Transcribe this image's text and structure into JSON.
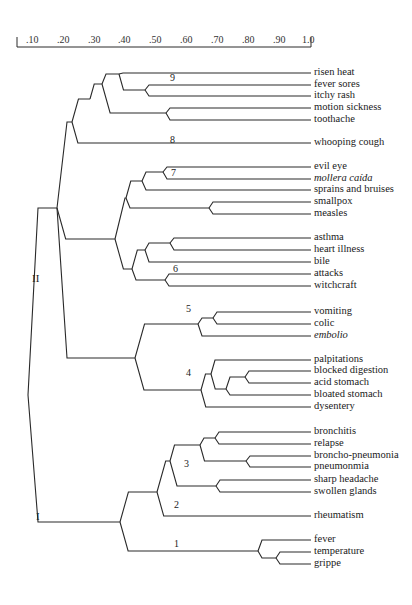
{
  "chart_data": {
    "type": "dendrogram",
    "title": "",
    "axis": {
      "ticks": [
        ".10",
        ".20",
        ".30",
        ".40",
        ".50",
        ".60",
        ".70",
        ".80",
        ".90",
        "1.0"
      ],
      "tick_x": [
        26,
        57,
        88,
        118,
        149,
        180,
        211,
        242,
        273,
        302
      ],
      "x_start": 17,
      "x_end": 311,
      "y": 47,
      "range": [
        0.05,
        1.0
      ]
    },
    "groups": [
      {
        "label": "II",
        "x": 32,
        "y": 278
      },
      {
        "label": "I",
        "x": 36,
        "y": 516
      }
    ],
    "clusters": [
      {
        "label": "9",
        "x": 60,
        "y": 100,
        "px": 57,
        "py": 98
      },
      {
        "label": "8",
        "x": 56,
        "y": 141,
        "px": 53,
        "py": 139
      },
      {
        "label": "7",
        "x": 80,
        "y": 181,
        "px": 60,
        "py": 180
      },
      {
        "label": "6",
        "x": 85,
        "y": 262,
        "px": 77,
        "py": 261
      },
      {
        "label": "5",
        "x": 185,
        "y": 321,
        "px": 185,
        "py": 320
      },
      {
        "label": "4",
        "x": 185,
        "y": 381,
        "px": 185,
        "py": 380
      },
      {
        "label": "3",
        "x": 185,
        "y": 467,
        "px": 186,
        "py": 466
      },
      {
        "label": "2",
        "x": 177,
        "y": 509,
        "px": 176,
        "py": 508
      },
      {
        "label": "1",
        "x": 177,
        "y": 547,
        "px": 177,
        "py": 546
      }
    ],
    "leaves": [
      {
        "label": "risen heat",
        "y": 73,
        "italic": false
      },
      {
        "label": "fever sores",
        "y": 85,
        "italic": false
      },
      {
        "label": "itchy rash",
        "y": 96,
        "italic": false
      },
      {
        "label": "motion sickness",
        "y": 108,
        "italic": false
      },
      {
        "label": "toothache",
        "y": 120,
        "italic": false
      },
      {
        "label": "whooping cough",
        "y": 143,
        "italic": false
      },
      {
        "label": "evil eye",
        "y": 167,
        "italic": false
      },
      {
        "label": "mollera caída",
        "y": 179,
        "italic": true
      },
      {
        "label": "sprains and bruises",
        "y": 190,
        "italic": false
      },
      {
        "label": "smallpox",
        "y": 202,
        "italic": false
      },
      {
        "label": "measles",
        "y": 214,
        "italic": false
      },
      {
        "label": "asthma",
        "y": 238,
        "italic": false
      },
      {
        "label": "heart illness",
        "y": 250,
        "italic": false
      },
      {
        "label": "bile",
        "y": 262,
        "italic": false
      },
      {
        "label": "attacks",
        "y": 274,
        "italic": false
      },
      {
        "label": "witchcraft",
        "y": 286,
        "italic": false
      },
      {
        "label": "vomiting",
        "y": 312,
        "italic": false
      },
      {
        "label": "colic",
        "y": 324,
        "italic": false
      },
      {
        "label": "embolio",
        "y": 336,
        "italic": true
      },
      {
        "label": "palpitations",
        "y": 360,
        "italic": false
      },
      {
        "label": "blocked digestion",
        "y": 371,
        "italic": false
      },
      {
        "label": "acid stomach",
        "y": 383,
        "italic": false
      },
      {
        "label": "bloated stomach",
        "y": 395,
        "italic": false
      },
      {
        "label": "dysentery",
        "y": 407,
        "italic": false
      },
      {
        "label": "bronchitis",
        "y": 432,
        "italic": false
      },
      {
        "label": "relapse",
        "y": 444,
        "italic": false
      },
      {
        "label": "broncho-pneumonia",
        "y": 456,
        "italic": false
      },
      {
        "label": "pneumonmia",
        "y": 467,
        "italic": false
      },
      {
        "label": "sharp headache",
        "y": 480,
        "italic": false
      },
      {
        "label": "swollen glands",
        "y": 492,
        "italic": false
      },
      {
        "label": "rheumatism",
        "y": 516,
        "italic": false
      },
      {
        "label": "fever",
        "y": 540,
        "italic": false
      },
      {
        "label": "temperature",
        "y": 552,
        "italic": false
      },
      {
        "label": "grippe",
        "y": 564,
        "italic": false
      }
    ],
    "leaf_x_end": 311,
    "tree": {
      "id": "root",
      "x": 28,
      "y": 395,
      "children": [
        {
          "id": "II",
          "x": 57,
          "y": 208,
          "children": [
            {
              "id": "II-a",
              "x": 72,
              "y": 122,
              "children": [
                {
                  "id": "c9",
                  "x": 90,
                  "y": 99,
                  "children": [
                    {
                      "x": 102,
                      "y": 84,
                      "children": [
                        {
                          "x": 119,
                          "y": 74,
                          "children": [
                            {
                              "leaf": 0
                            },
                            {
                              "x": 145,
                              "y": 90,
                              "children": [
                                {
                                  "leaf": 1
                                },
                                {
                                  "leaf": 2
                                }
                              ]
                            }
                          ]
                        },
                        {
                          "x": 166,
                          "y": 113,
                          "children": [
                            {
                              "leaf": 3
                            },
                            {
                              "leaf": 4
                            }
                          ]
                        }
                      ]
                    }
                  ]
                },
                {
                  "id": "c8",
                  "leaf": 5
                }
              ]
            },
            {
              "id": "II-b",
              "x": 115,
              "y": 239,
              "children": [
                {
                  "id": "c7",
                  "x": 126,
                  "y": 198,
                  "children": [
                    {
                      "x": 142,
                      "y": 181,
                      "children": [
                        {
                          "x": 163,
                          "y": 172,
                          "children": [
                            {
                              "leaf": 6
                            },
                            {
                              "leaf": 7
                            }
                          ]
                        },
                        {
                          "leaf": 8
                        }
                      ]
                    },
                    {
                      "x": 209,
                      "y": 208,
                      "children": [
                        {
                          "leaf": 9
                        },
                        {
                          "leaf": 10
                        }
                      ]
                    }
                  ]
                },
                {
                  "id": "c6",
                  "x": 132,
                  "y": 269,
                  "children": [
                    {
                      "x": 145,
                      "y": 250,
                      "children": [
                        {
                          "x": 170,
                          "y": 243,
                          "children": [
                            {
                              "leaf": 11
                            },
                            {
                              "leaf": 12
                            }
                          ]
                        },
                        {
                          "leaf": 13
                        }
                      ]
                    },
                    {
                      "x": 165,
                      "y": 280,
                      "children": [
                        {
                          "leaf": 14
                        },
                        {
                          "leaf": 15
                        }
                      ]
                    }
                  ]
                }
              ]
            },
            {
              "id": "II-c",
              "x": 135,
              "y": 358,
              "children": [
                {
                  "id": "c5",
                  "x": 198,
                  "y": 324,
                  "children": [
                    {
                      "x": 213,
                      "y": 318,
                      "children": [
                        {
                          "leaf": 16
                        },
                        {
                          "leaf": 17
                        }
                      ]
                    },
                    {
                      "leaf": 18
                    }
                  ]
                },
                {
                  "id": "c4",
                  "x": 201,
                  "y": 390,
                  "children": [
                    {
                      "x": 211,
                      "y": 374,
                      "children": [
                        {
                          "leaf": 19
                        },
                        {
                          "x": 226,
                          "y": 389,
                          "children": [
                            {
                              "x": 245,
                              "y": 377,
                              "children": [
                                {
                                  "leaf": 20
                                },
                                {
                                  "leaf": 21
                                }
                              ]
                            },
                            {
                              "leaf": 22
                            }
                          ]
                        }
                      ]
                    },
                    {
                      "leaf": 23
                    }
                  ]
                }
              ]
            }
          ]
        },
        {
          "id": "I",
          "x": 120,
          "y": 522,
          "children": [
            {
              "x": 157,
              "y": 492,
              "children": [
                {
                  "id": "c3",
                  "x": 170,
                  "y": 461,
                  "children": [
                    {
                      "x": 200,
                      "y": 445,
                      "children": [
                        {
                          "x": 215,
                          "y": 438,
                          "children": [
                            {
                              "leaf": 24
                            },
                            {
                              "leaf": 25
                            }
                          ]
                        },
                        {
                          "x": 246,
                          "y": 461,
                          "children": [
                            {
                              "leaf": 26
                            },
                            {
                              "leaf": 27
                            }
                          ]
                        }
                      ]
                    },
                    {
                      "x": 216,
                      "y": 486,
                      "children": [
                        {
                          "leaf": 28
                        },
                        {
                          "leaf": 29
                        }
                      ]
                    }
                  ]
                },
                {
                  "id": "c2",
                  "leaf": 30
                }
              ]
            },
            {
              "id": "c1",
              "x": 258,
              "y": 551,
              "children": [
                {
                  "leaf": 31
                },
                {
                  "x": 276,
                  "y": 558,
                  "children": [
                    {
                      "leaf": 32
                    },
                    {
                      "leaf": 33
                    }
                  ]
                }
              ]
            }
          ]
        }
      ]
    }
  }
}
